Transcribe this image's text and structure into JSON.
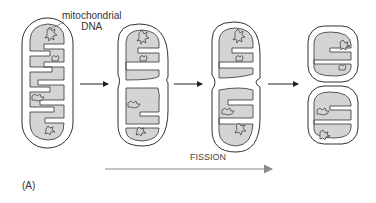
{
  "figure": {
    "panel_label": "(A)",
    "dna_label_line1": "mitochondrial",
    "dna_label_line2": "DNA",
    "process_label": "FISSION",
    "stages": [
      {
        "name": "stage-1",
        "description": "elongated mitochondrion with cristae and DNA nucleoids"
      },
      {
        "name": "stage-2",
        "description": "mitochondrion beginning to constrict"
      },
      {
        "name": "stage-3",
        "description": "mitochondrion deeply constricted at middle"
      },
      {
        "name": "stage-4",
        "description": "two daughter mitochondria after fission"
      }
    ],
    "colors": {
      "matrix_fill": "#d4d4d4",
      "outline": "#333333",
      "fission_arrow": "#8a8a8a",
      "step_arrow": "#222222"
    }
  }
}
